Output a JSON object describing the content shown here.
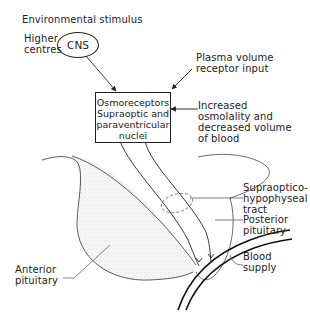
{
  "title": "Environmental stimulus",
  "cns": {
    "label": "CNS",
    "side_label_line1": "Higher",
    "side_label_line2": "centres"
  },
  "osmoreceptor_box": {
    "line1": "Osmoreceptors",
    "line2": "Supraoptic and",
    "line3": "paraventricular",
    "line4": "nuclei"
  },
  "inputs": {
    "plasma_volume_line1": "Plasma volume",
    "plasma_volume_line2": "receptor input",
    "osmolality_line1": "Increased",
    "osmolality_line2": "osmolality and",
    "osmolality_line3": "decreased volume",
    "osmolality_line4": "of blood"
  },
  "anatomy_labels": {
    "tract_line1": "Supraoptico-",
    "tract_line2": "hypophyseal",
    "tract_line3": "tract",
    "posterior_line1": "Posterior",
    "posterior_line2": "pituitary",
    "blood_line1": "Blood",
    "blood_line2": "supply",
    "anterior_line1": "Anterior",
    "anterior_line2": "pituitary"
  },
  "colors": {
    "line": "#222222",
    "anterior_fill": "#ececec"
  }
}
